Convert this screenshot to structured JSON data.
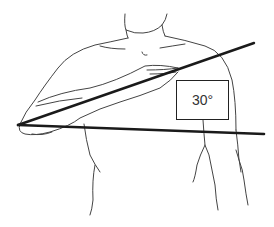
{
  "figure": {
    "angle_label": "30°",
    "colors": {
      "background": "#ffffff",
      "line": "#222222",
      "sketch": "#444444"
    }
  }
}
